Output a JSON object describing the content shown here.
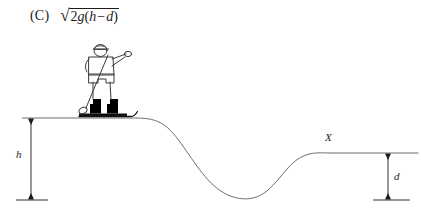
{
  "figure": {
    "kind": "physics-diagram",
    "line_color": "#6e6e6e",
    "ink_color": "#1b1b1b",
    "background": "#ffffff"
  },
  "answer": {
    "choice_label": "(C)",
    "formula_text": "√(2g(h − d))",
    "radical_glyph": "√",
    "radicand": {
      "coefficient": "2",
      "gravity_symbol": "g",
      "open_paren": "(",
      "height_symbol": "h",
      "operator": "−",
      "depth_symbol": "d",
      "close_paren": ")"
    }
  },
  "labels": {
    "height_h": "h",
    "depth_d": "d",
    "point_x": "X"
  },
  "geometry": {
    "datum_y": 200,
    "hilltop_y": 118,
    "ledge_y": 153,
    "valley_bottom_y": 198,
    "h_dimension_x": 31,
    "d_dimension_x": 388,
    "point_x_position": {
      "x": 327,
      "y": 137
    }
  },
  "skier": {
    "has_cap": true,
    "pointing_arm_direction": "right",
    "boot_count": 2,
    "pole_count": 1,
    "ski_count": 1,
    "boot_color": "#000000",
    "body_outline_color": "#3a3a3a"
  }
}
